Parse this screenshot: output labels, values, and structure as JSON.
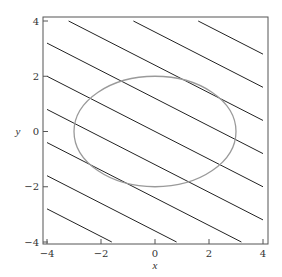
{
  "chart_data": {
    "type": "line",
    "title": "",
    "xlabel": "x",
    "ylabel": "y",
    "xlim": [
      -4,
      4
    ],
    "ylim": [
      -4,
      4
    ],
    "grid": false,
    "x_ticks": [
      -4,
      -2,
      0,
      2,
      4
    ],
    "y_ticks": [
      -4,
      -2,
      0,
      2,
      4
    ],
    "x_tick_labels": [
      "−4",
      "−2",
      "0",
      "2",
      "4"
    ],
    "y_tick_labels": [
      "−4",
      "−2",
      "0",
      "2",
      "4"
    ],
    "series": [
      {
        "name": "level-lines",
        "kind": "parallel-lines",
        "description": "lines y = -x/2 + c",
        "slope": -0.5,
        "intercepts": [
          -4.8,
          -3.6,
          -2.4,
          -1.2,
          0,
          1.2,
          2.4,
          3.6,
          4.8
        ],
        "color": "#222222"
      },
      {
        "name": "ellipse",
        "kind": "ellipse",
        "description": "x^2/9 + y^2/4 = 1",
        "center": [
          0,
          0
        ],
        "semi_axes": [
          3,
          2
        ],
        "color": "#9a9a9a"
      }
    ]
  }
}
